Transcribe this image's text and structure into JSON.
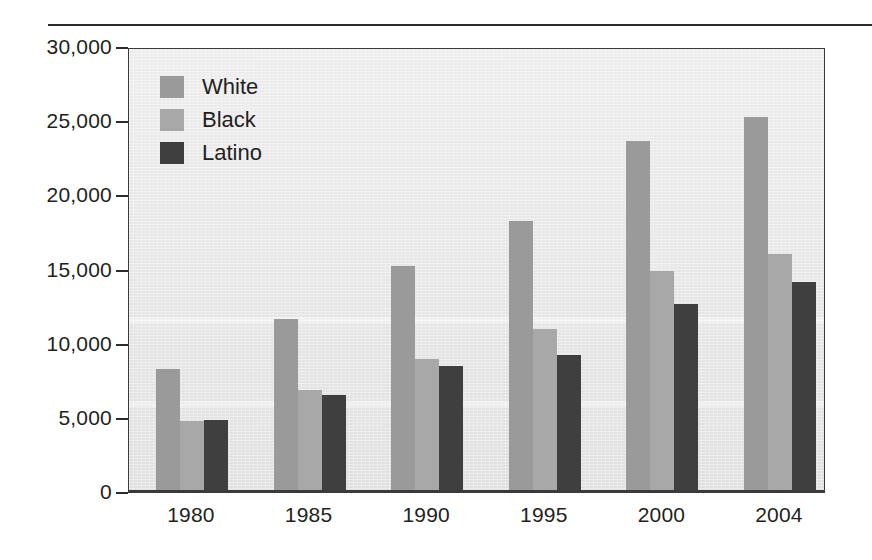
{
  "chart_data": {
    "type": "bar",
    "title": "",
    "subtitle": "",
    "xlabel": "",
    "ylabel": "",
    "categories": [
      "1980",
      "1985",
      "1990",
      "1995",
      "2000",
      "2004"
    ],
    "series": [
      {
        "name": "White",
        "color": "#9a9a9a",
        "values": [
          8200,
          11600,
          15200,
          18200,
          23600,
          25200
        ]
      },
      {
        "name": "Black",
        "color": "#a8a8a8",
        "values": [
          4750,
          6800,
          8900,
          10900,
          14800,
          16000
        ]
      },
      {
        "name": "Latino",
        "color": "#3f3f3f",
        "values": [
          4800,
          6500,
          8400,
          9200,
          12600,
          14100
        ]
      }
    ],
    "ylim": [
      0,
      30000
    ],
    "yticks": [
      0,
      5000,
      10000,
      15000,
      20000,
      25000,
      30000
    ],
    "ytick_labels": [
      "0",
      "5,000",
      "10,000",
      "15,000",
      "20,000",
      "25,000",
      "30,000"
    ],
    "grid": false,
    "legend_position": "top-left",
    "plot_background": "#e7e7e7",
    "axis_color": "#3a3a3a"
  },
  "legend": {
    "items": [
      {
        "label": "White"
      },
      {
        "label": "Black"
      },
      {
        "label": "Latino"
      }
    ]
  }
}
